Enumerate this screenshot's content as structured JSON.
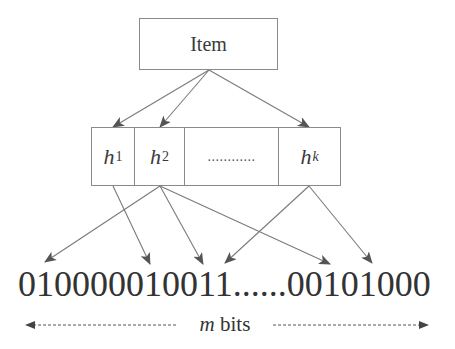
{
  "diagram": {
    "item": {
      "label": "Item"
    },
    "hash_functions": [
      {
        "name": "h",
        "sub": "1"
      },
      {
        "name": "h",
        "sub": "2"
      },
      {
        "ellipsis": "............"
      },
      {
        "name": "h",
        "sub": "k"
      }
    ],
    "bit_array": "010000010011......00101000",
    "length_label": {
      "var": "m",
      "unit": " bits"
    },
    "colors": {
      "stroke": "#8a8a8a",
      "arrow": "#6e6e6e",
      "text": "#333333",
      "background": "#ffffff"
    }
  }
}
